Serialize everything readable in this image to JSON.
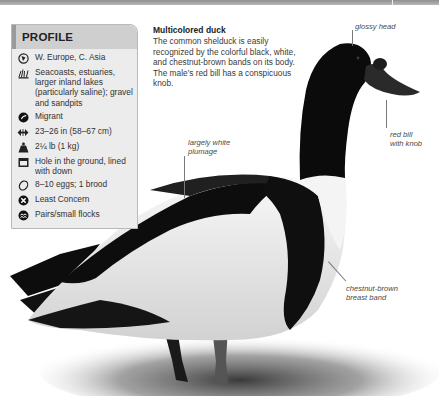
{
  "profile": {
    "title": "PROFILE",
    "items": [
      {
        "icon": "globe-icon",
        "text": "W. Europe, C. Asia"
      },
      {
        "icon": "habitat-reeds-icon",
        "text": "Seacoasts, estuaries, larger inland lakes (particularly saline); gravel and sandpits"
      },
      {
        "icon": "migration-arrow-icon",
        "text": "Migrant"
      },
      {
        "icon": "length-arrows-icon",
        "text": "23–26 in (58–67 cm)"
      },
      {
        "icon": "weight-icon",
        "text": "2¼ lb (1 kg)"
      },
      {
        "icon": "nest-icon",
        "text": "Hole in the ground, lined with down"
      },
      {
        "icon": "egg-icon",
        "text": "8–10 eggs; 1 brood"
      },
      {
        "icon": "conservation-status-icon",
        "text": "Least Concern"
      },
      {
        "icon": "flock-icon",
        "text": "Pairs/small flocks"
      }
    ]
  },
  "caption": {
    "title": "Multicolored duck",
    "body": "The common shelduck is easily recognized by the colorful black, white, and chestnut-brown bands on its body. The male’s red bill has a conspicuous knob."
  },
  "annotations": {
    "glossy_head": "glossy head",
    "red_bill": "red bill with knob",
    "red_bill_line1": "red bill",
    "red_bill_line2": "with knob",
    "white_plumage_line1": "largely white",
    "white_plumage_line2": "plumage",
    "breast_band_line1": "chestnut-brown",
    "breast_band_line2": "breast band"
  },
  "colors": {
    "profile_bg": "#ececec",
    "profile_header": "#cfcfcf",
    "profile_accent": "#9a9a9a",
    "bird_black": "#0d0d0d",
    "bird_white": "#f2f2f2"
  }
}
